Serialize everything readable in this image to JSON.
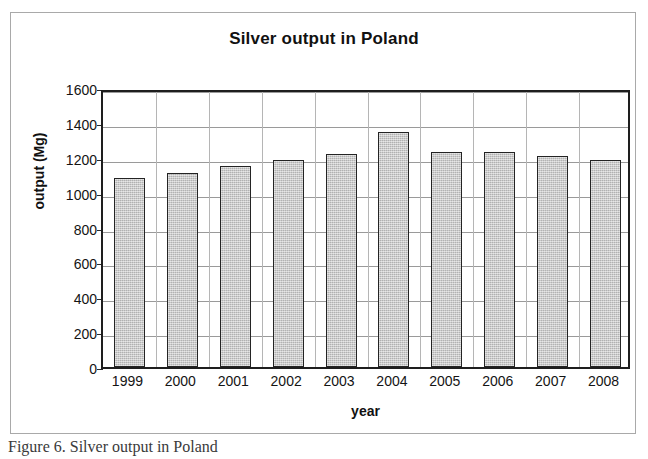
{
  "figure": {
    "caption": "Figure 6. Silver output in Poland"
  },
  "chart_data": {
    "type": "bar",
    "title": "Silver output in Poland",
    "xlabel": "year",
    "ylabel": "output (Mg)",
    "categories": [
      "1999",
      "2000",
      "2001",
      "2002",
      "2003",
      "2004",
      "2005",
      "2006",
      "2007",
      "2008"
    ],
    "values": [
      1085,
      1115,
      1155,
      1190,
      1220,
      1345,
      1235,
      1235,
      1210,
      1185
    ],
    "ylim": [
      0,
      1600
    ],
    "ytick_labels": [
      "0",
      "200",
      "400",
      "600",
      "800",
      "1000",
      "1200",
      "1400",
      "1600"
    ],
    "ytick_values": [
      0,
      200,
      400,
      600,
      800,
      1000,
      1200,
      1400,
      1600
    ],
    "grid": "horizontal",
    "legend": "none",
    "series_color": "#c3c3c3",
    "series_border_color": "#242424"
  }
}
